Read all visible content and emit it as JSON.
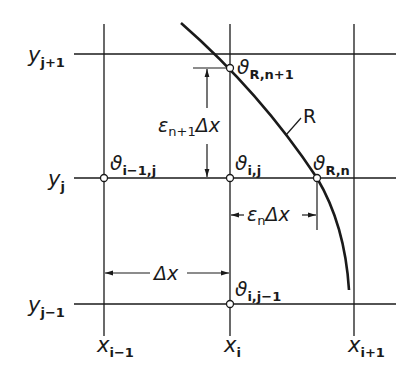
{
  "diagram": {
    "grid": {
      "columns": [
        {
          "id": "x_i-1",
          "base": "x",
          "sub": "i−1"
        },
        {
          "id": "x_i",
          "base": "x",
          "sub": "i"
        },
        {
          "id": "x_i+1",
          "base": "x",
          "sub": "i+1"
        }
      ],
      "rows": [
        {
          "id": "y_j+1",
          "base": "y",
          "sub": "j+1"
        },
        {
          "id": "y_j",
          "base": "y",
          "sub": "j"
        },
        {
          "id": "y_j-1",
          "base": "y",
          "sub": "j−1"
        }
      ]
    },
    "nodes": [
      {
        "id": "theta_i-1_j",
        "base": "ϑ",
        "sub": "i−1,j"
      },
      {
        "id": "theta_i_j",
        "base": "ϑ",
        "sub": "i,j"
      },
      {
        "id": "theta_i_j-1",
        "base": "ϑ",
        "sub": "i,j−1"
      },
      {
        "id": "theta_R_n",
        "base": "ϑ",
        "sub": "R,n"
      },
      {
        "id": "theta_R_n+1",
        "base": "ϑ",
        "sub": "R,n+1"
      }
    ],
    "boundary": {
      "label": "R"
    },
    "dimensions": {
      "dx": {
        "text": "Δx"
      },
      "eps_n": {
        "eps": "ε",
        "sub": "n",
        "tail": "Δx"
      },
      "eps_n1": {
        "eps": "ε",
        "sub": "n+1",
        "tail": "Δx"
      }
    },
    "colors": {
      "line": "#1a1a1a",
      "background": "#ffffff"
    }
  }
}
